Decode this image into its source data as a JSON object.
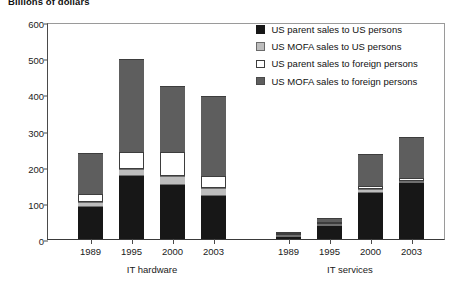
{
  "chart_data": {
    "type": "bar",
    "title": "Billions of dollars",
    "subtitle": "",
    "xlabel": "",
    "ylabel": "Billions of dollars",
    "stacked": true,
    "grid": false,
    "legend_position": "top-right",
    "ylim": [
      0,
      600
    ],
    "yticks": [
      0,
      100,
      200,
      300,
      400,
      500,
      600
    ],
    "ytick_labels": [
      "0",
      "100",
      "200",
      "300",
      "400",
      "500",
      "600"
    ],
    "categories": [
      "1989",
      "1995",
      "2000",
      "2003",
      "1989",
      "1995",
      "2000",
      "2003"
    ],
    "groups": [
      {
        "label": "IT hardware",
        "categories": [
          "1989",
          "1995",
          "2000",
          "2003"
        ]
      },
      {
        "label": "IT services",
        "categories": [
          "1989",
          "1995",
          "2000",
          "2003"
        ]
      }
    ],
    "series": [
      {
        "name": "US parent sales to US persons",
        "color": "#171717",
        "values": [
          88,
          175,
          150,
          120,
          6,
          35,
          128,
          155
        ]
      },
      {
        "name": "US MOFA sales to US persons",
        "color": "#bdbdbd",
        "values": [
          15,
          20,
          25,
          20,
          2,
          4,
          10,
          4
        ]
      },
      {
        "name": "US parent sales to foreign persons",
        "color": "#ffffff",
        "values": [
          22,
          45,
          65,
          35,
          2,
          6,
          8,
          9
        ]
      },
      {
        "name": "US MOFA sales to foreign persons",
        "color": "#5e5e5e",
        "values": [
          113,
          257,
          182,
          220,
          3,
          12,
          88,
          112
        ]
      }
    ],
    "totals": [
      238,
      497,
      422,
      395,
      13,
      57,
      234,
      280
    ]
  },
  "legend": {
    "items": [
      {
        "label": "US parent sales to US persons",
        "swatch": "black-swatch"
      },
      {
        "label": "US MOFA sales to US persons",
        "swatch": "light-gray-swatch"
      },
      {
        "label": "US parent sales to foreign persons",
        "swatch": "white-swatch"
      },
      {
        "label": "US MOFA sales to foreign persons",
        "swatch": "dark-gray-swatch"
      }
    ]
  }
}
